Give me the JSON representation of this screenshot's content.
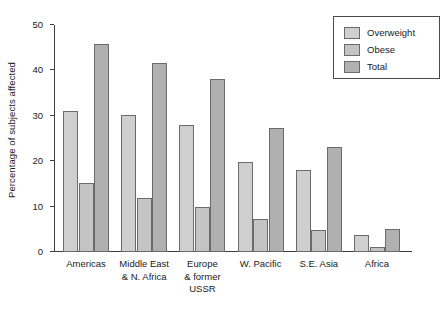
{
  "chart_data": {
    "type": "bar",
    "title": "",
    "xlabel": "",
    "ylabel": "Percentage of subjects affected",
    "ylim": [
      0,
      50
    ],
    "yticks": [
      0,
      10,
      20,
      30,
      40,
      50
    ],
    "ytick_labels": [
      "0",
      "10",
      "20",
      "30",
      "40",
      "50"
    ],
    "grid": false,
    "legend_position": "top-right",
    "categories": [
      "Americas",
      "Middle East\n& N. Africa",
      "Europe\n& former\nUSSR",
      "W. Pacific",
      "S.E. Asia",
      "Africa"
    ],
    "series": [
      {
        "name": "Overweight",
        "color": "#cfcfcf",
        "values": [
          31.1,
          30.1,
          28.0,
          19.8,
          18.0,
          3.7
        ]
      },
      {
        "name": "Obese",
        "color": "#c4c4c4",
        "values": [
          15.1,
          11.9,
          10.0,
          7.2,
          4.9,
          1.0
        ]
      },
      {
        "name": "Total",
        "color": "#b0b0b0",
        "values": [
          45.9,
          41.6,
          38.0,
          27.3,
          23.1,
          5.0
        ]
      }
    ]
  },
  "legend": {
    "items": [
      {
        "label": "Overweight"
      },
      {
        "label": "Obese"
      },
      {
        "label": "Total"
      }
    ]
  },
  "axis": {
    "y_title": "Percentage of subjects affected"
  }
}
